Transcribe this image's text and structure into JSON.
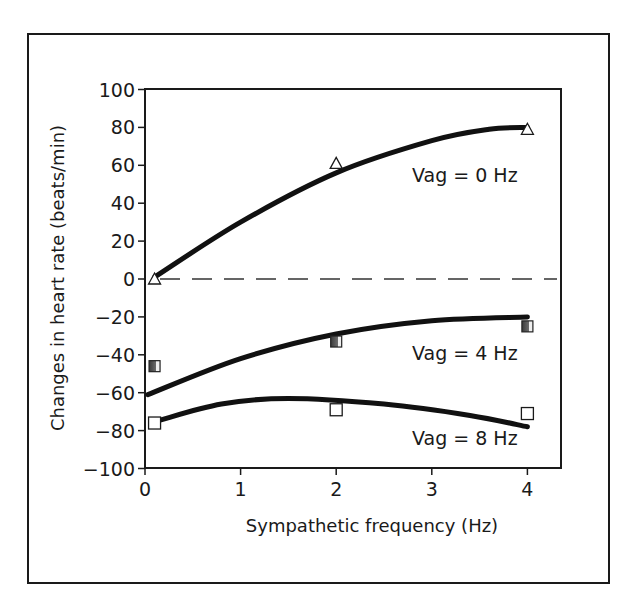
{
  "chart_data": {
    "type": "line",
    "title": "",
    "xlabel": "Sympathetic frequency (Hz)",
    "ylabel": "Changes in heart rate (beats/min)",
    "xlim": [
      0,
      4.35
    ],
    "ylim": [
      -100,
      100
    ],
    "xticks": [
      0,
      1,
      2,
      3,
      4
    ],
    "yticks": [
      100,
      80,
      60,
      40,
      20,
      0,
      -20,
      -40,
      -60,
      -80,
      -100
    ],
    "grid": false,
    "legend": "inline labels",
    "reference_line": {
      "y": 0,
      "style": "dashed"
    },
    "series": [
      {
        "name": "Vag = 0 Hz",
        "marker": "open-triangle",
        "points": [
          {
            "x": 0.1,
            "y": 0
          },
          {
            "x": 2,
            "y": 61
          },
          {
            "x": 4,
            "y": 79
          }
        ],
        "fit_curve": [
          {
            "x": 0.1,
            "y": 1
          },
          {
            "x": 1,
            "y": 30
          },
          {
            "x": 2,
            "y": 56
          },
          {
            "x": 3,
            "y": 73
          },
          {
            "x": 3.6,
            "y": 79
          },
          {
            "x": 4,
            "y": 80
          }
        ],
        "label_pos": {
          "x": 2.8,
          "y": 55
        }
      },
      {
        "name": "Vag = 4 Hz",
        "marker": "half-filled-square",
        "points": [
          {
            "x": 0.1,
            "y": -46
          },
          {
            "x": 2,
            "y": -33
          },
          {
            "x": 4,
            "y": -25
          }
        ],
        "fit_curve": [
          {
            "x": 0.03,
            "y": -61
          },
          {
            "x": 1,
            "y": -42
          },
          {
            "x": 2,
            "y": -29
          },
          {
            "x": 3,
            "y": -22
          },
          {
            "x": 4,
            "y": -20
          }
        ],
        "label_pos": {
          "x": 2.8,
          "y": -39
        }
      },
      {
        "name": "Vag = 8 Hz",
        "marker": "open-square",
        "points": [
          {
            "x": 0.1,
            "y": -76
          },
          {
            "x": 2,
            "y": -69
          },
          {
            "x": 4,
            "y": -71
          }
        ],
        "fit_curve": [
          {
            "x": 0.12,
            "y": -75
          },
          {
            "x": 0.8,
            "y": -66
          },
          {
            "x": 1.5,
            "y": -63
          },
          {
            "x": 2.5,
            "y": -66
          },
          {
            "x": 3.4,
            "y": -72
          },
          {
            "x": 4,
            "y": -78
          }
        ],
        "label_pos": {
          "x": 2.8,
          "y": -84
        }
      }
    ]
  },
  "frame": {
    "outer_color": "#1a1a1a",
    "line_color": "#111111",
    "marker_dark": "#444444",
    "marker_light": "#e6e6e6"
  }
}
